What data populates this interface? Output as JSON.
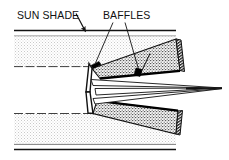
{
  "figure": {
    "type": "technical-cross-section-diagram",
    "title_visible": false,
    "background_color": "#ffffff",
    "ink_color": "#111111",
    "labels": [
      {
        "id": "sun-shade",
        "text": "SUN SHADE",
        "x": 17,
        "y": 19,
        "leader": {
          "from_x": 76,
          "from_y": 14,
          "to_x": 84,
          "to_y": 31,
          "arrow": true
        }
      },
      {
        "id": "baffles",
        "text": "BAFFLES",
        "x": 103,
        "y": 19,
        "leaders": [
          {
            "from_x": 112,
            "from_y": 22,
            "to_x": 95,
            "to_y": 63,
            "arrow": false
          },
          {
            "from_x": 126,
            "from_y": 22,
            "to_x": 139,
            "to_y": 70,
            "arrow": false
          }
        ]
      }
    ],
    "parts": {
      "upper_shade_tube": {
        "name": "upper-sun-shade-tube",
        "fill": "#f2f2f2",
        "stroke": "#111111"
      },
      "lower_shade_tube": {
        "name": "lower-sun-shade-tube",
        "fill": "#f2f2f2",
        "stroke": "#111111"
      },
      "upper_baffle_cone": {
        "name": "upper-baffle-cone",
        "fill": "stipple-dark",
        "stroke": "#111111"
      },
      "lower_baffle_cone": {
        "name": "lower-baffle-cone",
        "fill": "stipple-dark",
        "stroke": "#111111"
      },
      "baffle_vane_upper": {
        "name": "upper-baffle-vane",
        "fill": "#000000"
      },
      "baffle_vane_lower": {
        "name": "lower-baffle-vane",
        "fill": "#000000"
      },
      "light_rays": {
        "name": "converging-light-rays",
        "focus_x": 222,
        "focus_y": 88,
        "stroke": "#111111"
      }
    }
  }
}
